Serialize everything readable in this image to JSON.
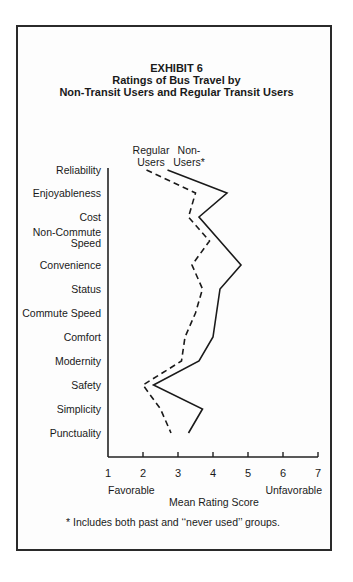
{
  "header": {
    "exhibit": "EXHIBIT  6",
    "title_line1": "Ratings of Bus Travel by",
    "title_line2": "Non-Transit Users and Regular Transit Users"
  },
  "legend": {
    "regular_line1": "Regular",
    "regular_line2": "Users",
    "non_line1": "Non-",
    "non_line2": "Users*"
  },
  "axis": {
    "favorable": "Favorable",
    "unfavorable": "Unfavorable",
    "xlabel": "Mean Rating Score"
  },
  "footnote": "* Includes both past and ‘‘never used’’ groups.",
  "chart_data": {
    "type": "line",
    "orientation": "horizontal-profile",
    "xlabel": "Mean Rating Score",
    "xlim": [
      1,
      7
    ],
    "x_ticks": [
      1,
      2,
      3,
      4,
      5,
      6,
      7
    ],
    "x_annotations": {
      "1": "Favorable",
      "7": "Unfavorable"
    },
    "categories": [
      "Reliability",
      "Enjoyableness",
      "Cost",
      "Non-Commute Speed",
      "Convenience",
      "Status",
      "Commute Speed",
      "Comfort",
      "Modernity",
      "Safety",
      "Simplicity",
      "Punctuality"
    ],
    "series": [
      {
        "name": "Regular Users",
        "style": "dashed",
        "values": [
          2.1,
          3.5,
          3.3,
          3.9,
          3.4,
          3.7,
          3.5,
          3.2,
          3.1,
          2.0,
          2.5,
          2.8
        ]
      },
      {
        "name": "Non-Users*",
        "style": "solid",
        "values": [
          2.7,
          4.4,
          3.6,
          4.2,
          4.8,
          4.2,
          4.1,
          4.0,
          3.6,
          2.3,
          3.7,
          3.3
        ]
      }
    ],
    "grid": false,
    "legend_position": "top, inline labels",
    "footnote": "* Includes both past and \"never used\" groups."
  }
}
